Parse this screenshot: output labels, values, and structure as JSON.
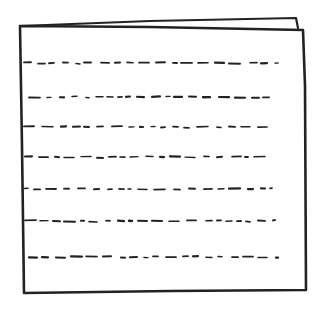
{
  "sketch": {
    "subject": "document-page-icon",
    "stroke_color": "#222222",
    "background_color": "#ffffff",
    "back_sheet": {
      "points": [
        [
          20,
          26
        ],
        [
          150,
          21
        ],
        [
          296,
          18
        ],
        [
          298,
          28
        ]
      ]
    },
    "front_sheet": {
      "x1": 20,
      "y1": 26,
      "x2": 305,
      "y2": 292
    },
    "text_lines": [
      {
        "y": 63,
        "x_start": 24,
        "x_end": 279
      },
      {
        "y": 97,
        "x_start": 29,
        "x_end": 277
      },
      {
        "y": 127,
        "x_start": 24,
        "x_end": 270
      },
      {
        "y": 157,
        "x_start": 25,
        "x_end": 267
      },
      {
        "y": 189,
        "x_start": 24,
        "x_end": 272
      },
      {
        "y": 221,
        "x_start": 25,
        "x_end": 275
      },
      {
        "y": 257,
        "x_start": 29,
        "x_end": 278
      }
    ]
  }
}
